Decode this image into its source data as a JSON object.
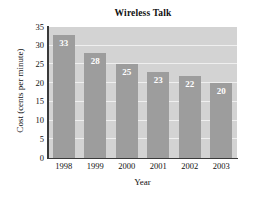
{
  "chart_data": {
    "type": "bar",
    "title": "Wireless Talk",
    "xlabel": "Year",
    "ylabel": "Cost (cents per minute)",
    "categories": [
      "1998",
      "1999",
      "2000",
      "2001",
      "2002",
      "2003"
    ],
    "values": [
      33,
      28,
      25,
      23,
      22,
      20
    ],
    "value_labels": [
      "33",
      "28",
      "25",
      "23",
      "22",
      "20"
    ],
    "ylim": [
      0,
      35
    ],
    "ytick_labels": [
      "0",
      "5",
      "10",
      "15",
      "20",
      "25",
      "30",
      "35"
    ],
    "ytick_values": [
      0,
      5,
      10,
      15,
      20,
      25,
      30,
      35
    ],
    "grid": true,
    "grid_axis": "y",
    "legend": false,
    "colors": {
      "bar_fill": "#9d9d9d",
      "plot_background": "#d3d3d3",
      "gridline": "#efefef",
      "axis_line": "#3a3a3a",
      "value_label": "#ffffff",
      "text": "#111111",
      "figure_background": "#ffffff"
    }
  }
}
